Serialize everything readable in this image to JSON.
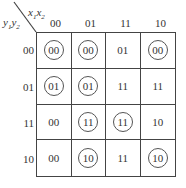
{
  "kmap": {
    "corner": {
      "col_var": "x1x2",
      "row_var": "y1y2"
    },
    "col_headers": [
      "00",
      "01",
      "11",
      "10"
    ],
    "row_headers": [
      "00",
      "01",
      "11",
      "10"
    ],
    "cells": [
      [
        {
          "value": "00",
          "circled": true
        },
        {
          "value": "00",
          "circled": true
        },
        {
          "value": "01",
          "circled": false
        },
        {
          "value": "00",
          "circled": true
        }
      ],
      [
        {
          "value": "01",
          "circled": true
        },
        {
          "value": "01",
          "circled": true
        },
        {
          "value": "11",
          "circled": false
        },
        {
          "value": "11",
          "circled": false
        }
      ],
      [
        {
          "value": "00",
          "circled": false
        },
        {
          "value": "11",
          "circled": true
        },
        {
          "value": "11",
          "circled": true
        },
        {
          "value": "10",
          "circled": false
        }
      ],
      [
        {
          "value": "00",
          "circled": false
        },
        {
          "value": "10",
          "circled": true
        },
        {
          "value": "11",
          "circled": false
        },
        {
          "value": "10",
          "circled": true
        }
      ]
    ]
  }
}
